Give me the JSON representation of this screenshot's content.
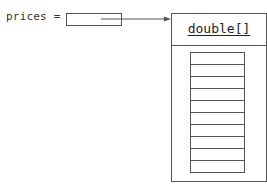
{
  "diagram": {
    "variable": {
      "label": "prices =",
      "name": "prices"
    },
    "array": {
      "type_label": "double[]",
      "cell_count": 10,
      "cells": [
        "",
        "",
        "",
        "",
        "",
        "",
        "",
        "",
        "",
        ""
      ]
    },
    "colors": {
      "line": "#555555",
      "text": "#222222",
      "background": "#ffffff"
    }
  }
}
